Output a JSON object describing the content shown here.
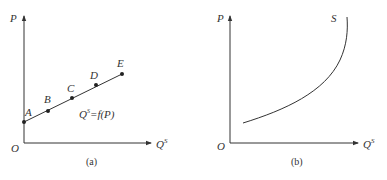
{
  "panels": [
    {
      "id": "a",
      "caption": "(a)",
      "origin_label": "O",
      "y_axis_label": "P",
      "x_axis_label": "Q",
      "x_axis_superscript": "S",
      "curve_label": "Q",
      "curve_label_sup": "S",
      "curve_label_rest": "=f(P)",
      "points": [
        {
          "label": "A"
        },
        {
          "label": "B"
        },
        {
          "label": "C"
        },
        {
          "label": "D"
        },
        {
          "label": "E"
        }
      ]
    },
    {
      "id": "b",
      "caption": "(b)",
      "origin_label": "O",
      "y_axis_label": "P",
      "x_axis_label": "Q",
      "x_axis_superscript": "S",
      "curve_label": "S"
    }
  ],
  "colors": {
    "stroke": "#333333"
  }
}
